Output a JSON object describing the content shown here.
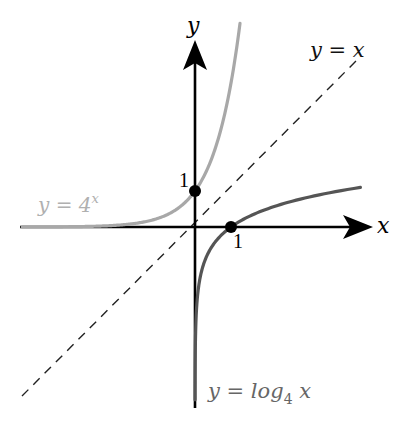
{
  "chart_data": {
    "type": "line",
    "title": "",
    "xlabel": "x",
    "ylabel": "y",
    "grid": false,
    "legend": "inline labels",
    "origin_px": [
      195,
      227
    ],
    "unit_px": 36,
    "xlim": [
      -4.8,
      4.9
    ],
    "ylim": [
      -5.0,
      5.3
    ],
    "series": [
      {
        "name": "y = 4^x",
        "label_base": "y = 4",
        "label_exp": "x",
        "color": "#a8a8a8",
        "function": "4^x",
        "x": [
          -4.8,
          -3,
          -2,
          -1.5,
          -1,
          -0.5,
          0,
          0.25,
          0.5,
          0.75,
          1,
          1.25
        ],
        "y": [
          0.0013,
          0.016,
          0.0625,
          0.125,
          0.25,
          0.5,
          1,
          1.414,
          2,
          2.83,
          4,
          5.3
        ]
      },
      {
        "name": "y = log_4 x",
        "label_main": "y = log",
        "label_sub": "4",
        "label_tail": " x",
        "color": "#555555",
        "function": "log_4(x)",
        "x": [
          0.0013,
          0.016,
          0.0625,
          0.125,
          0.25,
          0.5,
          1,
          1.5,
          2,
          3,
          4,
          4.6
        ],
        "y": [
          -4.8,
          -3,
          -2,
          -1.5,
          -1,
          -0.5,
          0,
          0.29,
          0.5,
          0.79,
          1,
          1.1
        ]
      },
      {
        "name": "y = x",
        "label": "y = x",
        "color": "#222222",
        "style": "dashed",
        "x": [
          -4.7,
          4.6
        ],
        "y": [
          -4.7,
          4.6
        ]
      }
    ],
    "points": [
      {
        "x": 0,
        "y": 1,
        "label": "1"
      },
      {
        "x": 1,
        "y": 0,
        "label": "1"
      }
    ],
    "axes": {
      "x_label": "x",
      "y_label": "y"
    }
  }
}
